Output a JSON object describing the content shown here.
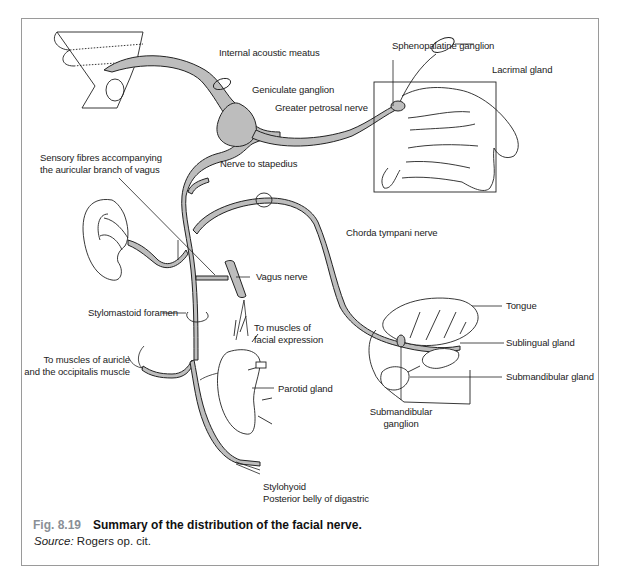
{
  "figure": {
    "number": "Fig. 8.19",
    "title": "Summary of the distribution of the facial nerve.",
    "source_prefix": "Source:",
    "source_text": "Rogers op. cit."
  },
  "labels": {
    "internal_acoustic_meatus": "Internal acoustic meatus",
    "geniculate_ganglion": "Geniculate ganglion",
    "greater_petrosal_nerve": "Greater petrosal nerve",
    "sphenopalatine_ganglion": "Sphenopalatine ganglion",
    "lacrimal_gland": "Lacrimal gland",
    "sensory_fibres_line1": "Sensory fibres accompanying",
    "sensory_fibres_line2": "the auricular branch of vagus",
    "nerve_to_stapedius": "Nerve to stapedius",
    "chorda_tympani_nerve": "Chorda tympani nerve",
    "vagus_nerve": "Vagus nerve",
    "stylomastoid_foramen": "Stylomastoid foramen",
    "tongue": "Tongue",
    "to_muscles_facial_line1": "To muscles of",
    "to_muscles_facial_line2": "facial expression",
    "sublingual_gland": "Sublingual gland",
    "to_muscles_auricle_line1": "To muscles of auricle",
    "to_muscles_auricle_line2": "and the occipitalis muscle",
    "submandibular_gland": "Submandibular gland",
    "parotid_gland": "Parotid gland",
    "submandibular_ganglion_line1": "Submandibular",
    "submandibular_ganglion_line2": "ganglion",
    "stylohyoid": "Stylohyoid",
    "posterior_belly_digastric": "Posterior belly of digastric"
  },
  "colors": {
    "nerve_fill": "#bdbdbd",
    "stroke": "#222222",
    "frame": "#9a9a9a",
    "fig_number": "#8a8f96"
  }
}
